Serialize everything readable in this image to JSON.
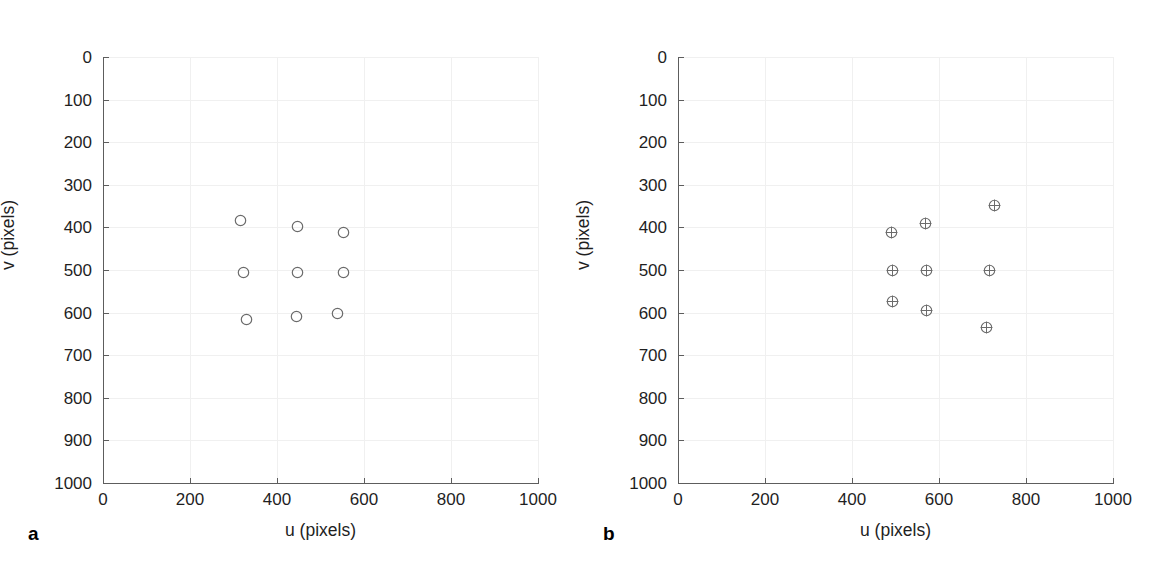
{
  "figure": {
    "background_color": "#ffffff",
    "marker_color": "#6b6b6b",
    "axis_color": "#5d5d5d",
    "grid_color": "#f0f0f0"
  },
  "panels": [
    {
      "id": "a",
      "label": "a",
      "marker_style": "open-circle"
    },
    {
      "id": "b",
      "label": "b",
      "marker_style": "circle-plus"
    }
  ],
  "axis": {
    "xlabel": "u (pixels)",
    "ylabel": "v (pixels)",
    "xticks": [
      "0",
      "200",
      "400",
      "600",
      "800",
      "1000"
    ],
    "yticks": [
      "0",
      "100",
      "200",
      "300",
      "400",
      "500",
      "600",
      "700",
      "800",
      "900",
      "1000"
    ]
  },
  "chart_data": [
    {
      "type": "scatter",
      "panel": "a",
      "title": "",
      "xlabel": "u (pixels)",
      "ylabel": "v (pixels)",
      "xlim": [
        0,
        1000
      ],
      "ylim": [
        1000,
        0
      ],
      "y_axis_inverted": true,
      "grid": true,
      "legend": null,
      "xtick_values": [
        0,
        200,
        400,
        600,
        800,
        1000
      ],
      "ytick_values": [
        0,
        100,
        200,
        300,
        400,
        500,
        600,
        700,
        800,
        900,
        1000
      ],
      "marker": "open-circle",
      "series": [
        {
          "name": "image points",
          "points": [
            {
              "u": 315,
              "v": 383
            },
            {
              "u": 448,
              "v": 399
            },
            {
              "u": 552,
              "v": 411
            },
            {
              "u": 324,
              "v": 507
            },
            {
              "u": 446,
              "v": 507
            },
            {
              "u": 554,
              "v": 507
            },
            {
              "u": 331,
              "v": 617
            },
            {
              "u": 444,
              "v": 610
            },
            {
              "u": 540,
              "v": 601
            }
          ]
        }
      ]
    },
    {
      "type": "scatter",
      "panel": "b",
      "title": "",
      "xlabel": "u (pixels)",
      "ylabel": "v (pixels)",
      "xlim": [
        0,
        1000
      ],
      "ylim": [
        1000,
        0
      ],
      "y_axis_inverted": true,
      "grid": true,
      "legend": null,
      "xtick_values": [
        0,
        200,
        400,
        600,
        800,
        1000
      ],
      "ytick_values": [
        0,
        100,
        200,
        300,
        400,
        500,
        600,
        700,
        800,
        900,
        1000
      ],
      "marker": "circle-plus",
      "series": [
        {
          "name": "image points",
          "points": [
            {
              "u": 490,
              "v": 411
            },
            {
              "u": 570,
              "v": 392
            },
            {
              "u": 728,
              "v": 348
            },
            {
              "u": 492,
              "v": 500
            },
            {
              "u": 572,
              "v": 500
            },
            {
              "u": 717,
              "v": 500
            },
            {
              "u": 492,
              "v": 573
            },
            {
              "u": 572,
              "v": 596
            },
            {
              "u": 710,
              "v": 636
            }
          ]
        }
      ]
    }
  ]
}
